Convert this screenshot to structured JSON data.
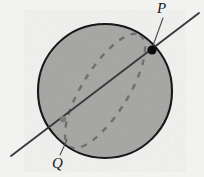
{
  "figure": {
    "background_color": "#f2f2f0",
    "canvas": {
      "width": 204,
      "height": 177
    }
  },
  "sphere": {
    "name": "shaded-sphere",
    "center": {
      "x": 105,
      "y": 91
    },
    "radius": 67,
    "fill_color": "#a9a9a7",
    "stroke_color": "#17171a",
    "stroke_width": 2.1
  },
  "great_circle": {
    "name": "dashed-great-circle",
    "description": "dashed tilted ellipse showing the equatorial great circle",
    "center": {
      "x": 105,
      "y": 91
    },
    "semi_major": 66,
    "semi_minor": 23,
    "rotation_deg": -58,
    "stroke_color": "#2b2b2e",
    "dash_pattern": "6 7",
    "stroke_width": 3.1,
    "back_arc_color": "#6f6f70",
    "back_arc_width": 2.4
  },
  "secant_line": {
    "name": "secant-line",
    "start": {
      "x": 11,
      "y": 156
    },
    "end": {
      "x": 199,
      "y": 13
    },
    "stroke_color": "#3a3a3d",
    "stroke_width": 1.9
  },
  "points": [
    {
      "id": "P",
      "label": "P",
      "name": "point-p",
      "x": 152,
      "y": 50,
      "marker": "filled-dot",
      "radius": 4.6,
      "color": "#0d0d10",
      "label_position": {
        "x": 157,
        "y": 1
      },
      "leader": {
        "from": {
          "x": 163,
          "y": 18
        },
        "to": {
          "x": 152.5,
          "y": 47
        }
      }
    },
    {
      "id": "Q",
      "label": "Q",
      "name": "point-q",
      "x": 63,
      "y": 119,
      "marker": "filled-dot",
      "radius": 3.3,
      "color": "#7b7b7c",
      "label_position": {
        "x": 52,
        "y": 156
      },
      "leader": {
        "from": {
          "x": 60,
          "y": 155
        },
        "to": {
          "x": 67,
          "y": 140
        }
      }
    }
  ],
  "leader_lines": {
    "stroke_color": "#4a4a4d",
    "stroke_width": 1.1
  }
}
